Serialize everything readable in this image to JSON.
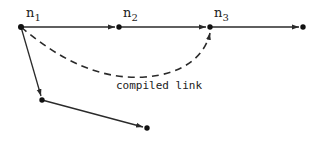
{
  "diagram": {
    "nodes": [
      {
        "id": "n1",
        "label": "n",
        "subscript": "1"
      },
      {
        "id": "n2",
        "label": "n",
        "subscript": "2"
      },
      {
        "id": "n3",
        "label": "n",
        "subscript": "3"
      },
      {
        "id": "n4",
        "label": "",
        "subscript": ""
      },
      {
        "id": "n5",
        "label": "",
        "subscript": ""
      },
      {
        "id": "n6",
        "label": "",
        "subscript": ""
      }
    ],
    "edges": [
      {
        "from": "n1",
        "to": "n2",
        "style": "solid"
      },
      {
        "from": "n2",
        "to": "n3",
        "style": "solid"
      },
      {
        "from": "n3",
        "to": "n4",
        "style": "solid"
      },
      {
        "from": "n1",
        "to": "n5",
        "style": "solid"
      },
      {
        "from": "n5",
        "to": "n6",
        "style": "solid"
      },
      {
        "from": "n1",
        "to": "n3",
        "style": "dashed",
        "label": "compiled link"
      }
    ],
    "compiled_link_label": "compiled link",
    "colors": {
      "stroke": "#2a2a2a",
      "node": "#111111",
      "background": "#ffffff"
    }
  }
}
